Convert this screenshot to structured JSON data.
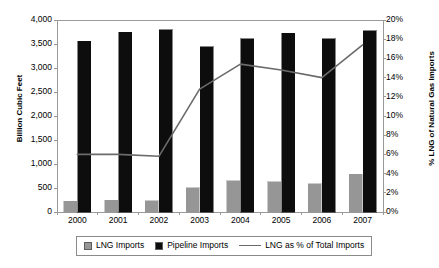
{
  "chart_data": {
    "type": "bar",
    "title": "",
    "subtitle": "",
    "categories": [
      "2000",
      "2001",
      "2002",
      "2003",
      "2004",
      "2005",
      "2006",
      "2007"
    ],
    "xlabel": "",
    "ylabel": "Billion Cubic Feet",
    "y2label": "% LNG of Natural Gas Imports",
    "ylim": [
      0,
      4000
    ],
    "y2lim": [
      0,
      20
    ],
    "yticks": [
      "0",
      "500",
      "1,000",
      "1,500",
      "2,000",
      "2,500",
      "3,000",
      "3,500",
      "4,000"
    ],
    "ytick_values": [
      0,
      500,
      1000,
      1500,
      2000,
      2500,
      3000,
      3500,
      4000
    ],
    "y2ticks": [
      "0%",
      "2%",
      "4%",
      "6%",
      "8%",
      "10%",
      "12%",
      "14%",
      "16%",
      "18%",
      "20%"
    ],
    "y2tick_values": [
      0,
      2,
      4,
      6,
      8,
      10,
      12,
      14,
      16,
      18,
      20
    ],
    "grid": false,
    "legend_position": "bottom",
    "series": [
      {
        "name": "LNG Imports",
        "type": "bar",
        "axis": "left",
        "color": "#969696",
        "values": [
          225,
          240,
          230,
          510,
          650,
          630,
          585,
          790
        ]
      },
      {
        "name": "Pipeline Imports",
        "type": "bar",
        "axis": "left",
        "color": "#0d0d0d",
        "values": [
          3560,
          3740,
          3800,
          3440,
          3610,
          3720,
          3610,
          3780
        ]
      },
      {
        "name": "LNG as % of Total Imports",
        "type": "line",
        "axis": "right",
        "color": "#6b6b6b",
        "values": [
          6.0,
          6.0,
          5.8,
          12.8,
          15.4,
          14.8,
          14.0,
          17.4
        ]
      }
    ]
  },
  "axes": {
    "left_title": "Billion Cubic Feet",
    "right_title": "% LNG of Natural Gas Imports"
  },
  "legend": {
    "items": [
      {
        "label": "LNG Imports",
        "marker": "square-gray-swatch"
      },
      {
        "label": "Pipeline Imports",
        "marker": "square-black-swatch"
      },
      {
        "label": "LNG as % of Total Imports",
        "marker": "line-gray-swatch"
      }
    ]
  }
}
